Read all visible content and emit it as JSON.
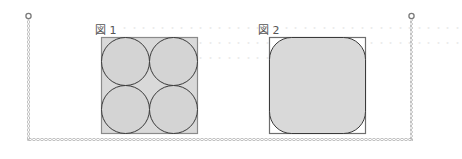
{
  "background_text": {
    "line1": "・・・・・・・・・・・・・・・・・・・・・・・・・・・・・・・・・・・・",
    "line2": "・・・・・・・・・・・・・・・・・・・・・・・・・・・・・・・・・・・・",
    "line3": "・・・・・・・・・・・・・・・・・・"
  },
  "figures": [
    {
      "label": "図 1",
      "description": "Square containing four equal circles arranged 2x2"
    },
    {
      "label": "図 2",
      "description": "Square containing a rounded square"
    }
  ],
  "colors": {
    "shape_fill": "#d9d9d9",
    "square_stroke": "#6e6e6e",
    "circle_stroke": "#3a3a3a",
    "border_chain": "#b5b5b5",
    "label_text": "#555555"
  }
}
